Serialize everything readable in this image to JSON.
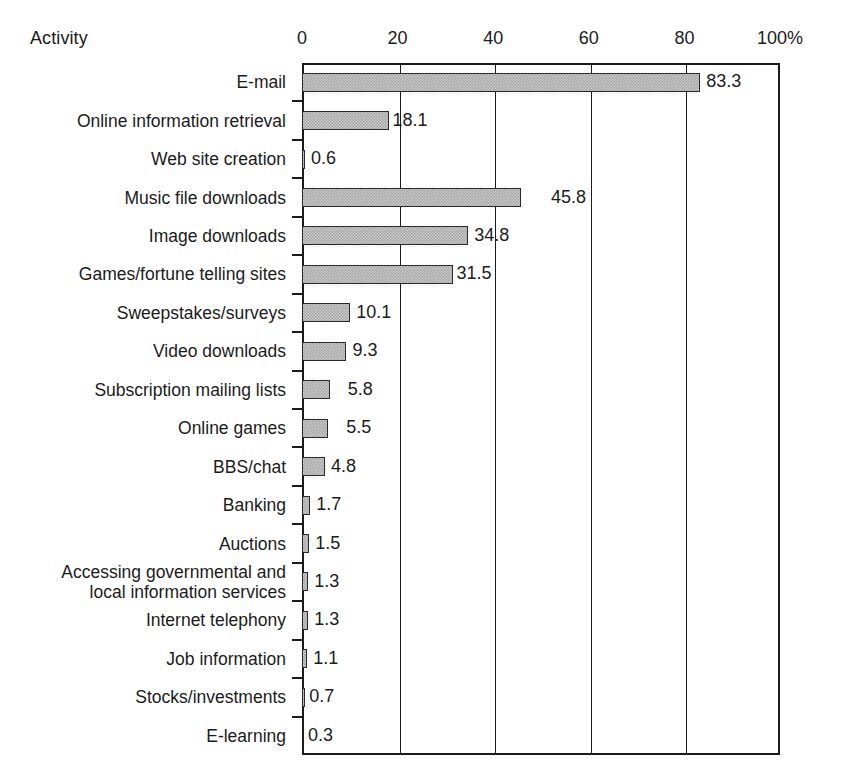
{
  "chart_data": {
    "type": "bar",
    "orientation": "horizontal",
    "title": "",
    "xlabel": "",
    "ylabel": "Activity",
    "xlim": [
      0,
      100
    ],
    "grid": true,
    "legend": null,
    "x_tick_labels": [
      "0",
      "20",
      "40",
      "60",
      "80",
      "100%"
    ],
    "x_ticks": [
      0,
      20,
      40,
      60,
      80,
      100
    ],
    "value_suffix": "%",
    "categories": [
      "E-mail",
      "Online information retrieval",
      "Web site creation",
      "Music file downloads",
      "Image downloads",
      "Games/fortune telling sites",
      "Sweepstakes/surveys",
      "Video downloads",
      "Subscription mailing lists",
      "Online games",
      "BBS/chat",
      "Banking",
      "Auctions",
      "Accessing governmental and\nlocal information services",
      "Internet telephony",
      "Job information",
      "Stocks/investments",
      "E-learning"
    ],
    "values": [
      83.3,
      18.1,
      0.6,
      45.8,
      34.8,
      31.5,
      10.1,
      9.3,
      5.8,
      5.5,
      4.8,
      1.7,
      1.5,
      1.3,
      1.3,
      1.1,
      0.7,
      0.3
    ],
    "value_labels": [
      "83.3",
      "18.1",
      "0.6",
      "45.8",
      "34.8",
      "31.5",
      "10.1",
      "9.3",
      "5.8",
      "5.5",
      "4.8",
      "1.7",
      "1.5",
      "1.3",
      "1.3",
      "1.1",
      "0.7",
      "0.3"
    ],
    "label_gap_px": [
      6,
      4,
      6,
      30,
      6,
      4,
      6,
      6,
      18,
      18,
      6,
      6,
      6,
      6,
      6,
      6,
      4,
      6
    ],
    "bar_color": "#a9a9a9",
    "bar_edge_color": "#2a2a2a",
    "axis_color": "#1b1b1b"
  },
  "axis": {
    "y_axis_title": "Activity"
  }
}
